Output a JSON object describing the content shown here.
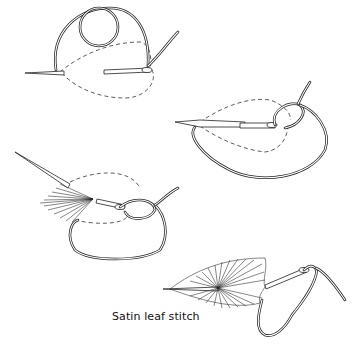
{
  "figure": {
    "caption": "Satin leaf stitch",
    "steps": [
      {
        "id": 1,
        "description": "needle with looped thread, dashed leaf outline"
      },
      {
        "id": 2,
        "description": "needle passing through thread loop"
      },
      {
        "id": 3,
        "description": "partially worked satin leaf with needle"
      },
      {
        "id": 4,
        "description": "completed satin leaf with thread"
      }
    ],
    "colors": {
      "line": "#222222",
      "background": "#ffffff"
    }
  }
}
